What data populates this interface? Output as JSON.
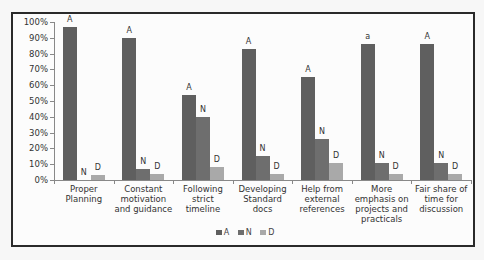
{
  "chart_data": {
    "type": "bar",
    "title": "",
    "xlabel": "",
    "ylabel": "",
    "ylim": [
      0,
      100
    ],
    "yticks": [
      "0%",
      "10%",
      "20%",
      "30%",
      "40%",
      "50%",
      "60%",
      "70%",
      "80%",
      "90%",
      "100%"
    ],
    "grid": false,
    "legend_position": "bottom",
    "categories": [
      "Proper Planning",
      "Constant motivation and guidance",
      "Following strict timeline",
      "Developing Standard docs",
      "Help from external references",
      "More emphasis on projects and practicals",
      "Fair share of time for discussion"
    ],
    "category_lines": [
      [
        "Proper",
        "Planning"
      ],
      [
        "Constant",
        "motivation",
        "and guidance"
      ],
      [
        "Following",
        "strict",
        "timeline"
      ],
      [
        "Developing",
        "Standard",
        "docs"
      ],
      [
        "Help from",
        "external",
        "references"
      ],
      [
        "More",
        "emphasis on",
        "projects and",
        "practicals"
      ],
      [
        "Fair share of",
        "time for",
        "discussion"
      ]
    ],
    "series": [
      {
        "name": "A",
        "color": "#5f5f5f",
        "values": [
          97,
          90,
          54,
          83,
          65,
          86,
          86
        ],
        "labels": [
          "A",
          "A",
          "A",
          "A",
          "A",
          "a",
          "A"
        ]
      },
      {
        "name": "N",
        "color": "#6e6e6e",
        "values": [
          0,
          7,
          40,
          15,
          26,
          11,
          11
        ],
        "labels": [
          "N",
          "N",
          "N",
          "N",
          "N",
          "N",
          "N"
        ]
      },
      {
        "name": "D",
        "color": "#a9a9a9",
        "values": [
          3,
          4,
          8,
          4,
          11,
          4,
          4
        ],
        "labels": [
          "D",
          "D",
          "D",
          "D",
          "D",
          "D",
          "D"
        ]
      }
    ]
  },
  "legend": [
    {
      "label": "A",
      "color": "#5f5f5f"
    },
    {
      "label": "N",
      "color": "#6e6e6e"
    },
    {
      "label": "D",
      "color": "#a9a9a9"
    }
  ]
}
